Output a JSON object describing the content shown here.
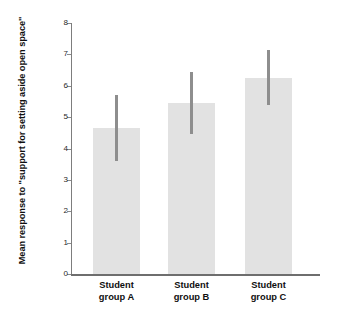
{
  "chart_data": {
    "type": "bar",
    "title": "",
    "xlabel": "",
    "ylabel": "Mean response to \"support for setting aside open space\"",
    "categories": [
      "Student\ngroup A",
      "Student\ngroup B",
      "Student\ngroup C"
    ],
    "category_names": [
      "Student group A",
      "Student group B",
      "Student group C"
    ],
    "values": [
      4.65,
      5.45,
      6.25
    ],
    "errors_high": [
      5.7,
      6.45,
      7.15
    ],
    "errors_low": [
      3.6,
      4.45,
      5.4
    ],
    "ylim": [
      0,
      8
    ],
    "ytick_labels": [
      "0",
      "1",
      "2",
      "3",
      "4",
      "5",
      "6",
      "7",
      "8"
    ],
    "ytick_values": [
      0,
      1,
      2,
      3,
      4,
      5,
      6,
      7,
      8
    ],
    "grid": false,
    "legend": "none",
    "colors": {
      "bar_fill": "#e2e2e2",
      "error_bar": "#8e8e8e",
      "axis": "#7d7d7d",
      "text": "#101010",
      "background": "#ffffff"
    }
  }
}
